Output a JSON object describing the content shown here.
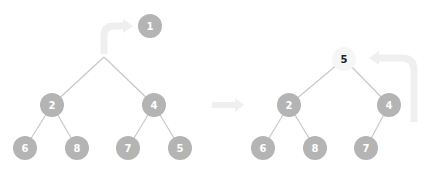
{
  "diagram": {
    "colors": {
      "node_fill": "#b4b4b4",
      "node_text": "#ffffff",
      "highlight_fill": "#f6f6f6",
      "highlight_text": "#222222",
      "edge": "#c8c8c8",
      "arrow": "#efefef"
    },
    "before": {
      "removed_root": {
        "label": "1",
        "x": 150,
        "y": 26
      },
      "root_junction": {
        "x": 104,
        "y": 57
      },
      "nodes": [
        {
          "id": "b2",
          "label": "2",
          "x": 52,
          "y": 105
        },
        {
          "id": "b4",
          "label": "4",
          "x": 154,
          "y": 105
        },
        {
          "id": "b6",
          "label": "6",
          "x": 25,
          "y": 148
        },
        {
          "id": "b8",
          "label": "8",
          "x": 77,
          "y": 148
        },
        {
          "id": "b7",
          "label": "7",
          "x": 128,
          "y": 148
        },
        {
          "id": "b5",
          "label": "5",
          "x": 180,
          "y": 148
        }
      ]
    },
    "after": {
      "nodes": [
        {
          "id": "a5",
          "label": "5",
          "x": 344,
          "y": 59,
          "highlight": true
        },
        {
          "id": "a2",
          "label": "2",
          "x": 289,
          "y": 105
        },
        {
          "id": "a4",
          "label": "4",
          "x": 389,
          "y": 105
        },
        {
          "id": "a6",
          "label": "6",
          "x": 263,
          "y": 148
        },
        {
          "id": "a8",
          "label": "8",
          "x": 315,
          "y": 148
        },
        {
          "id": "a7",
          "label": "7",
          "x": 366,
          "y": 148
        }
      ]
    }
  }
}
